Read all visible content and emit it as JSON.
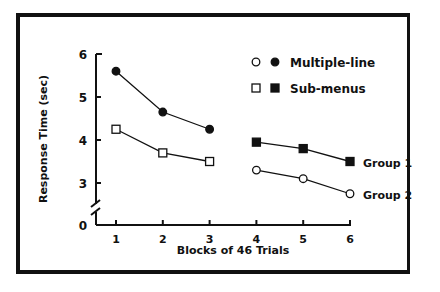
{
  "chart_data": {
    "type": "line",
    "title": "",
    "xlabel": "Blocks of 46 Trials",
    "ylabel": "Response Time (sec)",
    "x_ticks": [
      "1",
      "2",
      "3",
      "4",
      "5",
      "6"
    ],
    "y_ticks": [
      "0",
      "3",
      "4",
      "5",
      "6"
    ],
    "ylim": [
      0,
      6
    ],
    "axis_break": true,
    "grid": false,
    "legend": {
      "position": "top-right",
      "entries": [
        {
          "label": "Multiple-line",
          "markers": [
            "open-circle",
            "filled-circle"
          ]
        },
        {
          "label": "Sub-menus",
          "markers": [
            "open-square",
            "filled-square"
          ]
        }
      ]
    },
    "annotations": [
      "Group 1",
      "Group 2"
    ],
    "series": [
      {
        "name": "Multiple-line (Group 1, blocks 1-3)",
        "marker": "filled-circle",
        "x": [
          1,
          2,
          3
        ],
        "values": [
          5.6,
          4.65,
          4.25
        ]
      },
      {
        "name": "Sub-menus (Group 2, blocks 1-3)",
        "marker": "open-square",
        "x": [
          1,
          2,
          3
        ],
        "values": [
          4.25,
          3.7,
          3.5
        ]
      },
      {
        "name": "Sub-menus (Group 1, blocks 4-6)",
        "marker": "filled-square",
        "x": [
          4,
          5,
          6
        ],
        "values": [
          3.95,
          3.8,
          3.5
        ]
      },
      {
        "name": "Multiple-line (Group 2, blocks 4-6)",
        "marker": "open-circle",
        "x": [
          4,
          5,
          6
        ],
        "values": [
          3.3,
          3.1,
          2.75
        ]
      }
    ]
  }
}
